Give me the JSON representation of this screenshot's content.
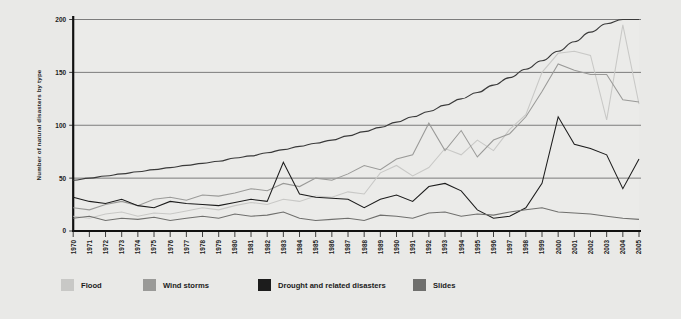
{
  "chart_data": {
    "type": "line",
    "title": "",
    "xlabel": "",
    "ylabel": "Number of natural disasters by type",
    "ylim": [
      0,
      200
    ],
    "yticks": [
      0,
      50,
      100,
      150,
      200
    ],
    "grid": "horizontal",
    "legend_position": "bottom",
    "x": [
      1970,
      1971,
      1972,
      1973,
      1974,
      1975,
      1976,
      1977,
      1978,
      1979,
      1980,
      1981,
      1982,
      1983,
      1984,
      1985,
      1986,
      1987,
      1988,
      1989,
      1990,
      1991,
      1992,
      1993,
      1994,
      1995,
      1996,
      1997,
      1998,
      1999,
      2000,
      2001,
      2002,
      2003,
      2004,
      2005
    ],
    "categories": [
      "1970",
      "1971",
      "1972",
      "1973",
      "1974",
      "1975",
      "1976",
      "1977",
      "1978",
      "1979",
      "1980",
      "1981",
      "1982",
      "1983",
      "1984",
      "1985",
      "1986",
      "1987",
      "1988",
      "1989",
      "1990",
      "1991",
      "1992",
      "1993",
      "1994",
      "1995",
      "1996",
      "1997",
      "1998",
      "1999",
      "2000",
      "2001",
      "2002",
      "2003",
      "2004",
      "2005"
    ],
    "series": [
      {
        "name": "Flood",
        "color": "#c8c8c6",
        "values": [
          14,
          12,
          16,
          18,
          14,
          17,
          16,
          19,
          22,
          20,
          24,
          27,
          25,
          30,
          28,
          33,
          32,
          37,
          35,
          55,
          62,
          52,
          60,
          78,
          72,
          86,
          76,
          96,
          110,
          150,
          168,
          170,
          166,
          105,
          195,
          120
        ]
      },
      {
        "name": "Wind storms",
        "color": "#9a9a98",
        "values": [
          22,
          20,
          25,
          28,
          24,
          30,
          32,
          29,
          34,
          33,
          36,
          40,
          38,
          45,
          42,
          50,
          48,
          54,
          62,
          58,
          68,
          72,
          102,
          76,
          95,
          70,
          86,
          92,
          108,
          132,
          158,
          152,
          148,
          148,
          124,
          122
        ]
      },
      {
        "name": "Drought and related disasters",
        "color": "#1c1c1c",
        "values": [
          32,
          28,
          26,
          30,
          24,
          22,
          28,
          26,
          25,
          24,
          27,
          30,
          28,
          65,
          35,
          32,
          31,
          30,
          22,
          30,
          34,
          28,
          42,
          45,
          38,
          20,
          12,
          14,
          22,
          45,
          108,
          82,
          78,
          72,
          40,
          68
        ]
      },
      {
        "name": "Slides",
        "color": "#6f6f6d",
        "values": [
          12,
          14,
          10,
          12,
          11,
          13,
          10,
          12,
          14,
          12,
          16,
          14,
          15,
          18,
          12,
          10,
          11,
          12,
          10,
          15,
          14,
          12,
          17,
          18,
          14,
          16,
          15,
          18,
          20,
          22,
          18,
          17,
          16,
          14,
          12,
          11
        ]
      }
    ],
    "trend": {
      "name": "trend-curve",
      "color": "#3a3a3a",
      "values": [
        48,
        50,
        52,
        54,
        56,
        58,
        60,
        62,
        64,
        66,
        69,
        71,
        74,
        77,
        80,
        83,
        86,
        90,
        94,
        98,
        103,
        108,
        113,
        119,
        125,
        131,
        138,
        145,
        153,
        161,
        170,
        179,
        188,
        196,
        200,
        200
      ]
    }
  },
  "legend": {
    "items": [
      {
        "label": "Flood",
        "color": "#c8c8c6"
      },
      {
        "label": "Wind storms",
        "color": "#9a9a98"
      },
      {
        "label": "Drought and related disasters",
        "color": "#1c1c1c"
      },
      {
        "label": "Slides",
        "color": "#6f6f6d"
      }
    ]
  }
}
